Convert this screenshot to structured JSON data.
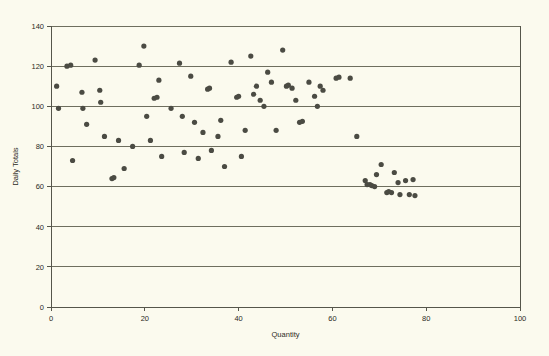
{
  "chart_data": {
    "type": "scatter",
    "title": "",
    "xlabel": "Quantity",
    "ylabel": "Daily Totals",
    "xlim": [
      0,
      100
    ],
    "ylim": [
      0,
      140
    ],
    "xticks": [
      0,
      20,
      40,
      60,
      80,
      100
    ],
    "yticks": [
      0,
      20,
      40,
      60,
      80,
      100,
      120,
      140
    ],
    "xtick_labels": [
      "0",
      "20",
      "40",
      "60",
      "80",
      "100"
    ],
    "ytick_labels": [
      "0",
      "20",
      "40",
      "60",
      "80",
      "100",
      "120",
      "140"
    ],
    "grid": "horizontal",
    "legend": null,
    "marker": {
      "shape": "circle",
      "color": "#4b4b43",
      "size": 5.2
    },
    "series": [
      {
        "name": "Daily Totals vs Quantity",
        "points": [
          [
            1.2,
            110.0
          ],
          [
            1.6,
            99.0
          ],
          [
            3.4,
            120.0
          ],
          [
            4.2,
            120.5
          ],
          [
            4.6,
            73.0
          ],
          [
            6.6,
            107.0
          ],
          [
            6.8,
            99.0
          ],
          [
            7.6,
            91.0
          ],
          [
            9.4,
            123.0
          ],
          [
            10.4,
            108.0
          ],
          [
            10.6,
            102.0
          ],
          [
            11.4,
            85.0
          ],
          [
            13.0,
            64.0
          ],
          [
            13.4,
            64.5
          ],
          [
            14.4,
            83.0
          ],
          [
            15.6,
            69.0
          ],
          [
            17.4,
            80.0
          ],
          [
            18.8,
            120.5
          ],
          [
            19.8,
            130.0
          ],
          [
            20.4,
            95.0
          ],
          [
            21.2,
            83.0
          ],
          [
            22.0,
            104.0
          ],
          [
            22.6,
            104.5
          ],
          [
            23.0,
            113.0
          ],
          [
            23.6,
            75.0
          ],
          [
            25.6,
            99.0
          ],
          [
            27.4,
            121.5
          ],
          [
            28.0,
            95.0
          ],
          [
            28.4,
            77.0
          ],
          [
            29.8,
            115.0
          ],
          [
            30.6,
            92.0
          ],
          [
            31.4,
            74.0
          ],
          [
            32.4,
            87.0
          ],
          [
            33.4,
            108.5
          ],
          [
            33.8,
            109.0
          ],
          [
            34.2,
            78.0
          ],
          [
            35.6,
            85.0
          ],
          [
            36.2,
            93.0
          ],
          [
            37.0,
            70.0
          ],
          [
            38.4,
            122.0
          ],
          [
            39.6,
            104.5
          ],
          [
            40.0,
            105.0
          ],
          [
            40.6,
            75.0
          ],
          [
            41.4,
            88.0
          ],
          [
            42.6,
            125.0
          ],
          [
            43.2,
            106.0
          ],
          [
            43.8,
            110.0
          ],
          [
            44.6,
            103.0
          ],
          [
            45.4,
            100.0
          ],
          [
            46.2,
            117.0
          ],
          [
            47.0,
            112.0
          ],
          [
            48.0,
            88.0
          ],
          [
            49.4,
            128.0
          ],
          [
            50.2,
            110.0
          ],
          [
            50.6,
            110.5
          ],
          [
            51.4,
            109.0
          ],
          [
            52.2,
            103.0
          ],
          [
            53.0,
            92.0
          ],
          [
            53.6,
            92.5
          ],
          [
            55.0,
            112.0
          ],
          [
            56.2,
            105.0
          ],
          [
            56.8,
            100.0
          ],
          [
            57.4,
            110.0
          ],
          [
            58.0,
            108.0
          ],
          [
            60.8,
            114.0
          ],
          [
            61.4,
            114.5
          ],
          [
            63.8,
            114.0
          ],
          [
            65.2,
            85.0
          ],
          [
            67.0,
            63.0
          ],
          [
            67.4,
            61.0
          ],
          [
            68.0,
            61.0
          ],
          [
            68.4,
            60.5
          ],
          [
            69.0,
            60.0
          ],
          [
            69.4,
            66.0
          ],
          [
            70.4,
            71.0
          ],
          [
            71.6,
            57.0
          ],
          [
            72.0,
            57.5
          ],
          [
            72.6,
            57.0
          ],
          [
            73.2,
            67.0
          ],
          [
            74.0,
            62.0
          ],
          [
            74.4,
            56.0
          ],
          [
            75.6,
            63.0
          ],
          [
            76.4,
            56.0
          ],
          [
            77.2,
            63.5
          ],
          [
            77.6,
            55.5
          ]
        ]
      }
    ]
  },
  "axes": {
    "x_axis_name": "x-axis",
    "y_axis_name": "y-axis"
  }
}
